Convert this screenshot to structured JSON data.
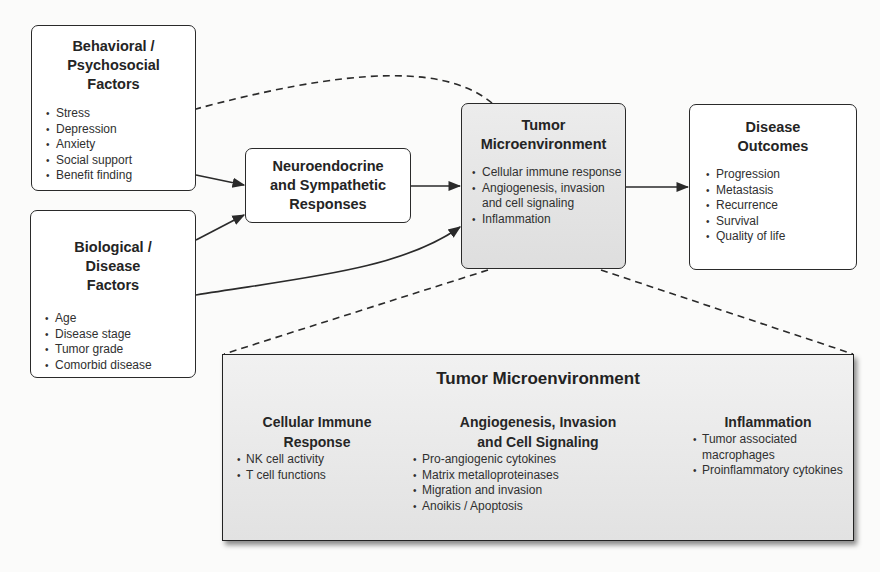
{
  "diagram": {
    "nodes": {
      "behavioral": {
        "title_lines": [
          "Behavioral /",
          "Psychosocial",
          "Factors"
        ],
        "items": [
          "Stress",
          "Depression",
          "Anxiety",
          "Social support",
          "Benefit finding"
        ]
      },
      "biological": {
        "title_lines": [
          "Biological /",
          "Disease",
          "Factors"
        ],
        "items": [
          "Age",
          "Disease stage",
          "Tumor grade",
          "Comorbid disease"
        ]
      },
      "neuroendocrine": {
        "title_lines": [
          "Neuroendocrine",
          "and Sympathetic",
          "Responses"
        ]
      },
      "tumor": {
        "title_lines": [
          "Tumor",
          "Microenvironment"
        ],
        "items": [
          "Cellular immune response",
          "Angiogenesis, invasion and cell signaling",
          "Inflammation"
        ],
        "fill": "#e4e4e4"
      },
      "outcomes": {
        "title_lines": [
          "Disease",
          "Outcomes"
        ],
        "items": [
          "Progression",
          "Metastasis",
          "Recurrence",
          "Survival",
          "Quality of life"
        ]
      }
    },
    "detail_panel": {
      "title": "Tumor Microenvironment",
      "columns": [
        {
          "title_lines": [
            "Cellular Immune",
            "Response"
          ],
          "items": [
            "NK cell activity",
            "T cell functions"
          ]
        },
        {
          "title_lines": [
            "Angiogenesis, Invasion",
            "and Cell Signaling"
          ],
          "items": [
            "Pro-angiogenic cytokines",
            "Matrix metalloproteinases",
            "Migration and invasion",
            "Anoikis / Apoptosis"
          ]
        },
        {
          "title_lines": [
            "Inflammation"
          ],
          "items": [
            "Tumor associated macrophages",
            "Proinflammatory cytokines"
          ]
        }
      ]
    },
    "edges": [
      {
        "from": "behavioral",
        "to": "neuroendocrine",
        "style": "solid"
      },
      {
        "from": "biological",
        "to": "neuroendocrine",
        "style": "solid"
      },
      {
        "from": "biological",
        "to": "tumor",
        "style": "solid"
      },
      {
        "from": "neuroendocrine",
        "to": "tumor",
        "style": "solid"
      },
      {
        "from": "tumor",
        "to": "outcomes",
        "style": "solid"
      },
      {
        "from": "tumor",
        "to": "behavioral",
        "style": "dashed"
      },
      {
        "from": "tumor",
        "to": "detail_panel",
        "style": "dashed-expansion"
      }
    ],
    "colors": {
      "stroke": "#2a2a2a",
      "box_fill": "#ffffff",
      "shaded_fill": "#e4e4e4",
      "background": "#fbfbfa"
    }
  }
}
